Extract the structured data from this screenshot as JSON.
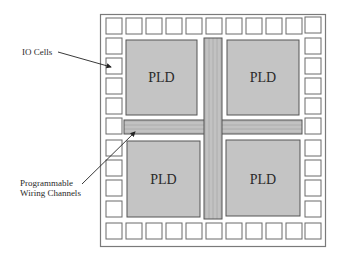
{
  "diagram": {
    "title": "",
    "labels": {
      "io_cells": "IO Cells",
      "wiring_line1": "Programmable",
      "wiring_line2": "Wiring Channels"
    },
    "blocks": [
      {
        "id": "pld-top-left",
        "label": "PLD"
      },
      {
        "id": "pld-top-right",
        "label": "PLD"
      },
      {
        "id": "pld-bottom-left",
        "label": "PLD"
      },
      {
        "id": "pld-bottom-right",
        "label": "PLD"
      }
    ],
    "io_cells": {
      "top_row_count": 9,
      "bottom_row_count": 9,
      "left_column_count": 7,
      "right_column_count": 7
    },
    "colors": {
      "pld_fill": "#c4c4c4",
      "channel_fill": "#bdbdbd",
      "border": "#555555",
      "io_cell_border": "#6a6a6a",
      "background": "#ffffff"
    }
  }
}
